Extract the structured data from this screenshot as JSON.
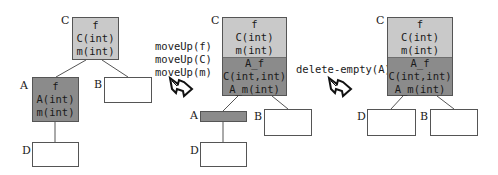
{
  "colors": {
    "light_gray": "#c9c9c9",
    "dark_gray": "#8b8b8b",
    "border": "#555555"
  },
  "stage1": {
    "C": {
      "label": "C",
      "members": [
        "f",
        "C(int)",
        "m(int)"
      ]
    },
    "A": {
      "label": "A",
      "members": [
        "f",
        "A(int)",
        "m(int)"
      ]
    },
    "B": {
      "label": "B",
      "members": []
    },
    "D": {
      "label": "D",
      "members": []
    }
  },
  "transform1": {
    "commands": [
      "moveUp(f)",
      "moveUp(C)",
      "moveUp(m)"
    ],
    "icon": "hollow-zigzag-arrow-icon"
  },
  "stage2": {
    "C": {
      "label": "C",
      "members_upper": [
        "f",
        "C(int)",
        "m(int)"
      ],
      "members_lower": [
        "A_f",
        "C(int,int)",
        "A_m(int)"
      ]
    },
    "A": {
      "label": "A",
      "members": []
    },
    "B": {
      "label": "B",
      "members": []
    },
    "D": {
      "label": "D",
      "members": []
    }
  },
  "transform2": {
    "commands": [
      "delete-empty(A)"
    ],
    "icon": "hollow-zigzag-arrow-icon"
  },
  "stage3": {
    "C": {
      "label": "C",
      "members_upper": [
        "f",
        "C(int)",
        "m(int)"
      ],
      "members_lower": [
        "A_f",
        "C(int,int)",
        "A_m(int)"
      ]
    },
    "D": {
      "label": "D",
      "members": []
    },
    "B": {
      "label": "B",
      "members": []
    }
  }
}
